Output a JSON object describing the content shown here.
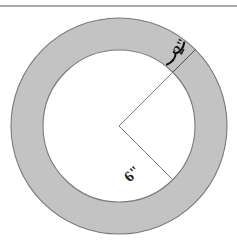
{
  "figure": {
    "background_color": "#ffffff",
    "canvas": {
      "width": 237,
      "height": 247
    },
    "top_rule": {
      "name": "top-horizontal-rule",
      "y": 6,
      "x_start": 0,
      "x_end": 237,
      "color": "#555555",
      "thickness": 1.2
    },
    "annulus": {
      "center_x": 119,
      "center_y": 126,
      "outer_radius": 108,
      "inner_radius": 76,
      "fill_color": "#c3c3c3",
      "stroke_color": "#7a7a7a",
      "inner_fill_color": "#ffffff",
      "stroke_width": 1.1
    },
    "radii": [
      {
        "name": "band-width-radius-line",
        "angle_deg": -45,
        "from_radius": 76,
        "to_radius": 108,
        "color": "#4a4a4a",
        "thickness": 1
      },
      {
        "name": "inner-radius-line-upper",
        "angle_deg": -45,
        "from_radius": 0,
        "to_radius": 76,
        "color": "#6b6b6b",
        "thickness": 0.9
      },
      {
        "name": "inner-radius-line-lower",
        "angle_deg": 45,
        "from_radius": 0,
        "to_radius": 76,
        "color": "#6b6b6b",
        "thickness": 0.9
      }
    ],
    "brace": {
      "name": "band-width-brace",
      "color": "#111111",
      "thickness": 2.1,
      "angle_deg": -45,
      "span_inner_radius": 78,
      "span_outer_radius": 106,
      "offset_deg": 7
    },
    "labels": [
      {
        "id": "band-width-label",
        "text": "2\"",
        "x": 182,
        "y": 47,
        "rotation_deg": -62,
        "font_size": 15,
        "color": "#1a1a1a"
      },
      {
        "id": "radius-label",
        "text": "6\"",
        "x": 133,
        "y": 175,
        "rotation_deg": -42,
        "font_size": 15,
        "color": "#1a1a1a"
      }
    ]
  },
  "chart_data": {
    "type": "diagram",
    "subtype": "annulus",
    "annotations": [
      {
        "label": "2\"",
        "meaning": "width of the shaded ring band",
        "value": 2,
        "unit": "inch"
      },
      {
        "label": "6\"",
        "meaning": "radius of the inner (white) circle",
        "value": 6,
        "unit": "inch"
      }
    ],
    "derived": {
      "inner_radius_in": 6,
      "band_width_in": 2,
      "outer_radius_in": 8
    },
    "pixel_geometry": {
      "center": [
        119,
        126
      ],
      "outer_radius_px": 108,
      "inner_radius_px": 76
    },
    "legend": null,
    "grid": false
  }
}
